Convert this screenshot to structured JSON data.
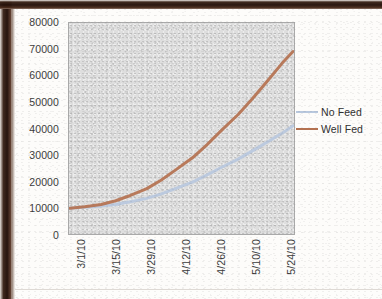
{
  "chart_data": {
    "type": "line",
    "title": "",
    "subtitle": "",
    "xlabel": "",
    "ylabel": "",
    "grid": false,
    "legend_position": "right",
    "plot_background": "#dedede",
    "ylim": [
      0,
      80000
    ],
    "ytick_labels": [
      "80000",
      "70000",
      "60000",
      "50000",
      "40000",
      "30000",
      "20000",
      "10000",
      "0"
    ],
    "ytick_values": [
      80000,
      70000,
      60000,
      50000,
      40000,
      30000,
      20000,
      10000,
      0
    ],
    "xtick_labels": [
      "3/1/10",
      "3/15/10",
      "3/29/10",
      "4/12/10",
      "4/26/10",
      "5/10/10",
      "5/24/10"
    ],
    "categories": [
      "3/1/10",
      "3/15/10",
      "3/29/10",
      "4/12/10",
      "4/26/10",
      "5/10/10",
      "5/24/10"
    ],
    "series": [
      {
        "name": "No Feed",
        "color": "#b8c8de",
        "values": [
          9800,
          12200,
          16200,
          21500,
          27000,
          32500,
          38200
        ]
      },
      {
        "name": "Well Fed",
        "color": "#b5714f",
        "values": [
          9800,
          12600,
          18600,
          27500,
          38500,
          50500,
          63500
        ]
      }
    ],
    "series_points": {
      "No Feed": [
        [
          0.0,
          9800
        ],
        [
          0.08,
          10100
        ],
        [
          0.17,
          10600
        ],
        [
          0.25,
          11200
        ],
        [
          0.33,
          12200
        ],
        [
          0.42,
          13500
        ],
        [
          0.5,
          15200
        ],
        [
          0.58,
          17300
        ],
        [
          0.67,
          19700
        ],
        [
          0.75,
          22400
        ],
        [
          0.83,
          25300
        ],
        [
          0.92,
          28400
        ],
        [
          1.0,
          31600
        ],
        [
          1.08,
          34900
        ],
        [
          1.16,
          38200
        ],
        [
          1.22,
          41000
        ]
      ],
      "Well Fed": [
        [
          0.0,
          9800
        ],
        [
          0.08,
          10300
        ],
        [
          0.17,
          11200
        ],
        [
          0.25,
          12600
        ],
        [
          0.33,
          14600
        ],
        [
          0.42,
          17200
        ],
        [
          0.5,
          20500
        ],
        [
          0.58,
          24400
        ],
        [
          0.67,
          28900
        ],
        [
          0.75,
          33900
        ],
        [
          0.83,
          39400
        ],
        [
          0.92,
          45300
        ],
        [
          1.0,
          51500
        ],
        [
          1.08,
          58000
        ],
        [
          1.16,
          64700
        ],
        [
          1.22,
          69200
        ]
      ]
    }
  },
  "legend": {
    "items": [
      {
        "label": "No Feed",
        "color": "#b8c8de"
      },
      {
        "label": "Well Fed",
        "color": "#b5714f"
      }
    ]
  }
}
